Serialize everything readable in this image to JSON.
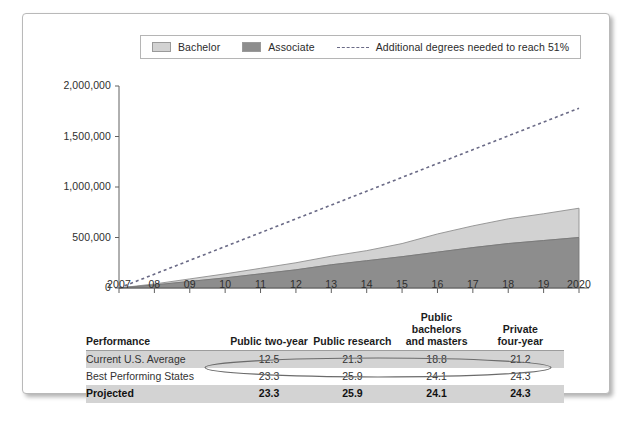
{
  "legend": {
    "items": [
      {
        "label": "Bachelor",
        "marker": "swatch",
        "color": "#d2d2d2",
        "name": "legend-bachelor"
      },
      {
        "label": "Associate",
        "marker": "swatch",
        "color": "#8d8d8d",
        "name": "legend-associate"
      },
      {
        "label": "Additional degrees needed to reach 51%",
        "marker": "dashed-line",
        "color": "#6a6a86",
        "name": "legend-additional"
      }
    ]
  },
  "chart_data": {
    "type": "area",
    "title": "",
    "xlabel": "",
    "ylabel": "",
    "stacked": true,
    "grid": false,
    "legend_position": "top",
    "x": [
      "2007",
      "08",
      "09",
      "10",
      "11",
      "12",
      "13",
      "14",
      "15",
      "16",
      "17",
      "18",
      "19",
      "2020"
    ],
    "x_values": [
      2007,
      2008,
      2009,
      2010,
      2011,
      2012,
      2013,
      2014,
      2015,
      2016,
      2017,
      2018,
      2019,
      2020
    ],
    "ytick_labels": [
      "0",
      "500,000",
      "1,000,000",
      "1,500,000",
      "2,000,000"
    ],
    "ytick_values": [
      0,
      500000,
      1000000,
      1500000,
      2000000
    ],
    "ylim": [
      0,
      2000000
    ],
    "xlim": [
      2007,
      2020
    ],
    "series": [
      {
        "name": "Associate",
        "color": "#8d8d8d",
        "values": [
          0,
          30000,
          65000,
          100000,
          140000,
          180000,
          230000,
          270000,
          310000,
          355000,
          400000,
          440000,
          470000,
          500000
        ]
      },
      {
        "name": "Bachelor",
        "color": "#d2d2d2",
        "values": [
          0,
          10000,
          25000,
          40000,
          55000,
          70000,
          85000,
          100000,
          130000,
          180000,
          215000,
          245000,
          265000,
          290000
        ]
      }
    ],
    "trend_line": {
      "name": "Additional degrees needed to reach 51%",
      "style": "dashed",
      "color": "#6a6a86",
      "x": [
        2007,
        2020
      ],
      "values": [
        0,
        1780000
      ]
    }
  },
  "table": {
    "columns": [
      "Performance",
      "Public two-year",
      "Public research",
      "Public bachelors and masters",
      "Private four-year"
    ],
    "column_lines": [
      [
        "Performance"
      ],
      [
        "Public two-year"
      ],
      [
        "Public research"
      ],
      [
        "Public bachelors",
        "and masters"
      ],
      [
        "Private",
        "four-year"
      ]
    ],
    "rows": [
      {
        "label": "Current U.S. Average",
        "values": [
          "12.5",
          "21.3",
          "18.8",
          "21.2"
        ],
        "style": "band"
      },
      {
        "label": "Best Performing States",
        "values": [
          "23.3",
          "25.9",
          "24.1",
          "24.3"
        ],
        "style": "plain"
      },
      {
        "label": "Projected",
        "values": [
          "23.3",
          "25.9",
          "24.1",
          "24.3"
        ],
        "style": "bold"
      }
    ],
    "annotation": {
      "type": "hand-drawn-ellipse",
      "target_row": "Best Performing States",
      "color": "#6b6b6b"
    }
  }
}
